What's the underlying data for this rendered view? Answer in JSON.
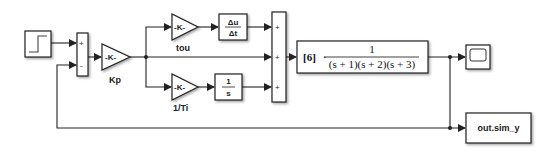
{
  "diagram": {
    "type": "simulink-pid-loop",
    "blocks": {
      "step": {
        "name": "Step"
      },
      "sum1": {
        "signs": [
          "+",
          "-"
        ]
      },
      "kp": {
        "text": "-K-",
        "label": "Kp"
      },
      "tou": {
        "text": "-K-",
        "label": "tou"
      },
      "derivative": {
        "num": "Δu",
        "den": "Δt"
      },
      "ti": {
        "text": "-K-",
        "label": "1/Ti"
      },
      "integrator": {
        "num": "1",
        "den": "s"
      },
      "sum2": {
        "signs": [
          "+",
          "+",
          "+"
        ]
      },
      "plant": {
        "gain": "[6]",
        "dot": "·",
        "num": "1",
        "den": "(s + 1)(s + 2)(s + 3)"
      },
      "scope": {
        "name": "Scope"
      },
      "to_workspace": {
        "text": "out.sim_y"
      }
    },
    "colors": {
      "line": "#222222",
      "block_fill": "#ffffff",
      "background": "#ffffff"
    }
  }
}
